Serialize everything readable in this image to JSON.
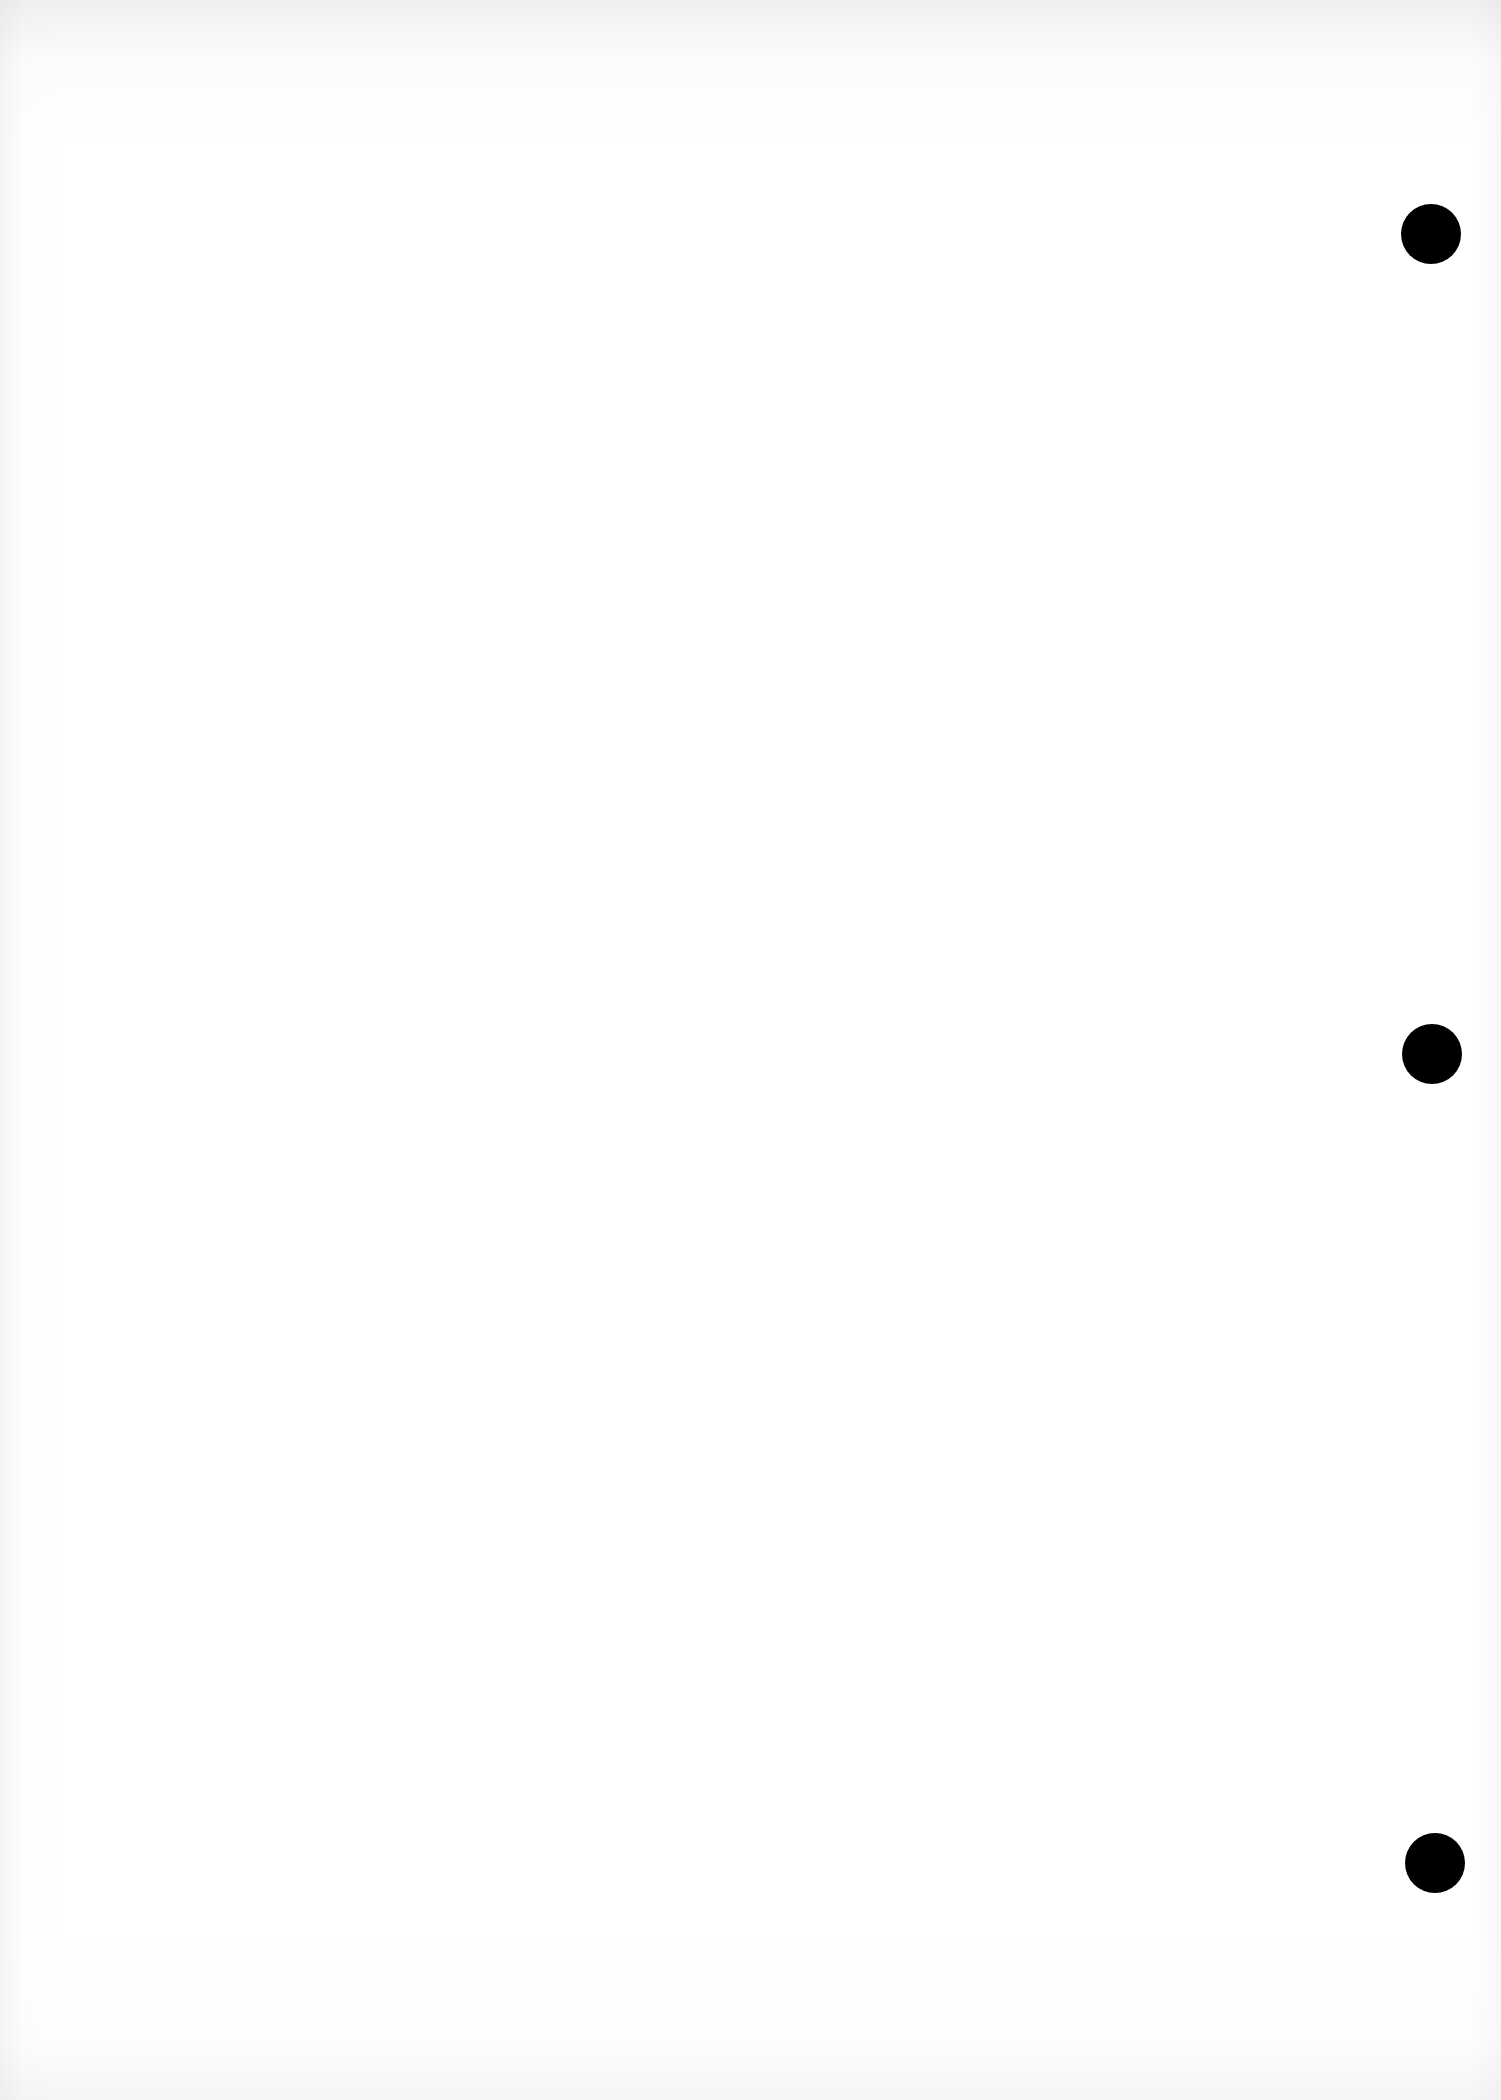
{
  "document": {
    "type": "blank-page",
    "background_color": "#ffffff",
    "text_content": ""
  },
  "punch_holes": [
    {
      "cx": 1431,
      "cy": 234,
      "diameter": 60,
      "color": "#000000"
    },
    {
      "cx": 1432,
      "cy": 1054,
      "diameter": 60,
      "color": "#000000"
    },
    {
      "cx": 1435,
      "cy": 1863,
      "diameter": 60,
      "color": "#000000"
    }
  ]
}
